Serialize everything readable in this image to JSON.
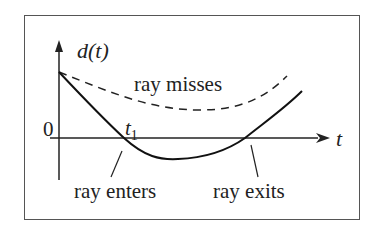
{
  "diagram": {
    "y_axis_label": "d(t)",
    "x_axis_label": "t",
    "origin_label": "0",
    "t1_label_base": "t",
    "t1_label_sub": "1",
    "curves": [
      {
        "name": "ray misses",
        "style": "dashed",
        "label": "ray misses"
      },
      {
        "name": "ray hits",
        "style": "solid"
      }
    ],
    "annotations": {
      "enter": "ray enters",
      "exit": "ray exits"
    },
    "colors": {
      "stroke": "#1a1a1a",
      "frame": "#555555"
    }
  }
}
